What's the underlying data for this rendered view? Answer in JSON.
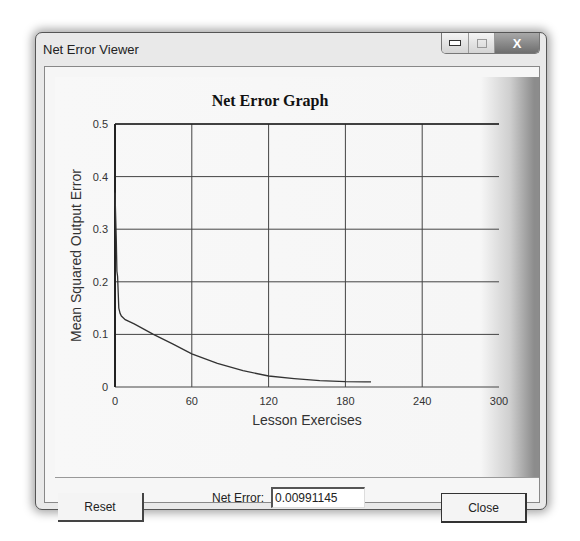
{
  "window": {
    "title": "Net Error Viewer",
    "controls": {
      "minimize": "minimize",
      "maximize": "maximize",
      "close": "X"
    }
  },
  "footer": {
    "reset_label": "Reset",
    "net_error_label": "Net Error:",
    "net_error_value": "0.00991145",
    "close_label": "Close"
  },
  "chart_data": {
    "type": "line",
    "title": "Net Error Graph",
    "xlabel": "Lesson Exercises",
    "ylabel": "Mean Squared Output Error",
    "xlim": [
      0,
      300
    ],
    "ylim": [
      0,
      0.5
    ],
    "xticks": [
      "0",
      "60",
      "120",
      "180",
      "240",
      "300"
    ],
    "yticks": [
      "0",
      "0.1",
      "0.2",
      "0.3",
      "0.4",
      "0.5"
    ],
    "grid": true,
    "legend": null,
    "series": [
      {
        "name": "Net Error",
        "x": [
          0,
          1,
          1.5,
          2,
          2.5,
          3,
          4,
          5,
          8,
          15,
          30,
          45,
          60,
          80,
          100,
          120,
          140,
          160,
          180,
          195,
          200
        ],
        "y": [
          0.37,
          0.28,
          0.22,
          0.21,
          0.18,
          0.15,
          0.14,
          0.135,
          0.128,
          0.12,
          0.1,
          0.082,
          0.063,
          0.045,
          0.031,
          0.021,
          0.016,
          0.012,
          0.01,
          0.0099,
          0.0099
        ]
      }
    ]
  }
}
